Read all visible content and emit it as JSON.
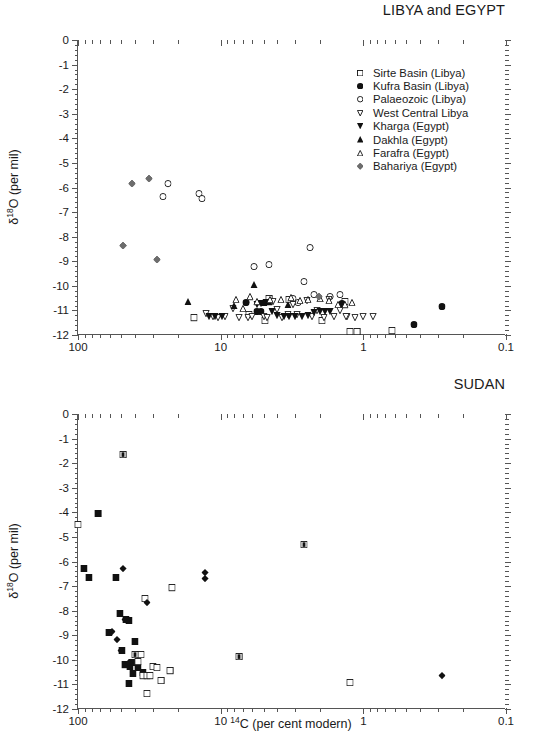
{
  "figure": {
    "xlabel_pre": "14",
    "xlabel_post": "C (per cent modern)",
    "ylabel_pre": "δ",
    "ylabel_sup": "18",
    "ylabel_post": "O (per mil)",
    "caption": ""
  },
  "panels": [
    {
      "id": "libya-egypt",
      "title": "LIBYA and EGYPT",
      "legend": [
        {
          "label": "Sirte Basin (Libya)",
          "marker": "open-square"
        },
        {
          "label": "Kufra Basin (Libya)",
          "marker": "filled-circle"
        },
        {
          "label": "Palaeozoic (Libya)",
          "marker": "open-circle"
        },
        {
          "label": "West Central Libya",
          "marker": "open-down-triangle"
        },
        {
          "label": "Kharga (Egypt)",
          "marker": "filled-down-triangle"
        },
        {
          "label": "Dakhla (Egypt)",
          "marker": "filled-up-triangle"
        },
        {
          "label": "Farafra (Egypt)",
          "marker": "open-up-triangle"
        },
        {
          "label": "Bahariya (Egypt)",
          "marker": "gray-diamond"
        }
      ]
    },
    {
      "id": "sudan",
      "title": "SUDAN",
      "legend": [
        {
          "label": "Darfur",
          "marker": "filled-square"
        },
        {
          "label": "Kordofan",
          "marker": "open-square"
        },
        {
          "label": "Dongola",
          "marker": "crossed-square"
        },
        {
          "label": "Butana",
          "marker": "filled-diamond"
        }
      ]
    }
  ],
  "chart_data": [
    {
      "type": "scatter",
      "title": "LIBYA and EGYPT",
      "xlabel": "14C (per cent modern)",
      "ylabel": "d18O (per mil)",
      "xscale": "log",
      "xlim": [
        100,
        0.1
      ],
      "ylim": [
        -12,
        0
      ],
      "xticks": [
        100,
        10,
        1,
        0.1
      ],
      "yticks": [
        0,
        -1,
        -2,
        -3,
        -4,
        -5,
        -6,
        -7,
        -8,
        -9,
        -10,
        -11,
        -12
      ],
      "grid": false,
      "legend_position": "upper-right",
      "series": [
        {
          "name": "Sirte Basin (Libya)",
          "marker": "open-square",
          "points": [
            [
              15.4,
              -11.25
            ],
            [
              6.3,
              -11.1
            ],
            [
              4.9,
              -11.35
            ],
            [
              4.55,
              -10.45
            ],
            [
              3.3,
              -10.5
            ],
            [
              1.95,
              -11.35
            ],
            [
              1.35,
              -10.6
            ],
            [
              1.25,
              -11.8
            ],
            [
              1.1,
              -11.8
            ],
            [
              0.63,
              -11.78
            ]
          ]
        },
        {
          "name": "Kufra Basin (Libya)",
          "marker": "filled-circle",
          "points": [
            [
              6.6,
              -10.62
            ],
            [
              5.6,
              -11.0
            ],
            [
              5.2,
              -11.0
            ],
            [
              1.42,
              -10.68
            ],
            [
              0.44,
              -11.5
            ],
            [
              0.28,
              -10.78
            ]
          ]
        },
        {
          "name": "Palaeozoic (Libya)",
          "marker": "open-circle",
          "points": [
            [
              23.5,
              -5.8
            ],
            [
              25.5,
              -6.3
            ],
            [
              14.3,
              -6.2
            ],
            [
              13.6,
              -6.4
            ],
            [
              5.8,
              -9.15
            ],
            [
              4.6,
              -9.07
            ],
            [
              2.35,
              -8.37
            ],
            [
              2.6,
              -9.78
            ],
            [
              2.2,
              -10.3
            ],
            [
              1.7,
              -10.4
            ],
            [
              1.45,
              -10.28
            ],
            [
              3.1,
              -10.45
            ],
            [
              2.85,
              -10.62
            ]
          ]
        },
        {
          "name": "West Central Libya",
          "marker": "open-down-triangle",
          "points": [
            [
              12.6,
              -11.08
            ],
            [
              11.4,
              -11.2
            ],
            [
              10.4,
              -11.25
            ],
            [
              9.3,
              -11.2
            ],
            [
              8.2,
              -10.85
            ],
            [
              7.4,
              -11.25
            ],
            [
              6.4,
              -11.22
            ],
            [
              6.0,
              -11.2
            ],
            [
              5.0,
              -11.2
            ],
            [
              4.7,
              -11.22
            ],
            [
              4.3,
              -10.6
            ],
            [
              4.0,
              -10.9
            ],
            [
              3.7,
              -11.22
            ],
            [
              3.4,
              -11.1
            ],
            [
              3.1,
              -10.7
            ],
            [
              2.9,
              -11.1
            ],
            [
              2.5,
              -10.55
            ],
            [
              2.3,
              -11.2
            ],
            [
              2.1,
              -10.95
            ],
            [
              1.9,
              -11.25
            ],
            [
              1.75,
              -10.5
            ],
            [
              1.6,
              -11.2
            ],
            [
              1.45,
              -10.95
            ],
            [
              1.3,
              -11.2
            ],
            [
              1.15,
              -11.22
            ],
            [
              1.0,
              -11.18
            ],
            [
              0.85,
              -11.2
            ],
            [
              1.32,
              -11.2
            ]
          ]
        },
        {
          "name": "Kharga (Egypt)",
          "marker": "filled-down-triangle",
          "points": [
            [
              12.0,
              -11.2
            ],
            [
              11.0,
              -11.2
            ],
            [
              9.8,
              -11.18
            ],
            [
              5.6,
              -10.7
            ],
            [
              5.2,
              -10.65
            ],
            [
              4.8,
              -10.62
            ],
            [
              4.4,
              -11.0
            ],
            [
              4.0,
              -11.15
            ],
            [
              3.6,
              -11.18
            ],
            [
              3.3,
              -11.2
            ],
            [
              3.0,
              -11.2
            ],
            [
              2.7,
              -11.18
            ],
            [
              2.45,
              -11.15
            ],
            [
              2.2,
              -11.05
            ],
            [
              2.0,
              -11.0
            ],
            [
              1.85,
              -11.0
            ],
            [
              1.7,
              -11.0
            ]
          ]
        },
        {
          "name": "Dakhla (Egypt)",
          "marker": "filled-up-triangle",
          "points": [
            [
              17.0,
              -10.58
            ],
            [
              8.0,
              -10.75
            ],
            [
              5.8,
              -9.9
            ],
            [
              5.0,
              -10.62
            ],
            [
              4.6,
              -10.6
            ],
            [
              3.4,
              -10.7
            ]
          ]
        },
        {
          "name": "Farafra (Egypt)",
          "marker": "open-up-triangle",
          "points": [
            [
              7.8,
              -10.5
            ],
            [
              7.0,
              -10.85
            ],
            [
              6.2,
              -10.4
            ],
            [
              5.6,
              -10.6
            ],
            [
              4.5,
              -10.52
            ],
            [
              3.8,
              -10.5
            ],
            [
              3.2,
              -10.42
            ],
            [
              2.8,
              -10.55
            ],
            [
              2.45,
              -10.5
            ],
            [
              2.0,
              -10.45
            ],
            [
              1.75,
              -10.55
            ],
            [
              1.5,
              -10.7
            ],
            [
              1.35,
              -10.72
            ],
            [
              1.2,
              -10.62
            ]
          ]
        },
        {
          "name": "Bahariya (Egypt)",
          "marker": "gray-diamond",
          "points": [
            [
              42.0,
              -5.78
            ],
            [
              32.0,
              -5.58
            ],
            [
              48.0,
              -8.3
            ],
            [
              28.0,
              -8.88
            ],
            [
              2.05,
              -10.4
            ]
          ]
        }
      ]
    },
    {
      "type": "scatter",
      "title": "SUDAN",
      "xlabel": "14C (per cent modern)",
      "ylabel": "d18O (per mil)",
      "xscale": "log",
      "xlim": [
        100,
        0.1
      ],
      "ylim": [
        -12,
        0
      ],
      "xticks": [
        100,
        10,
        1,
        0.1
      ],
      "yticks": [
        0,
        -1,
        -2,
        -3,
        -4,
        -5,
        -6,
        -7,
        -8,
        -9,
        -10,
        -11,
        -12
      ],
      "grid": false,
      "legend_position": "upper-right",
      "series": [
        {
          "name": "Darfur",
          "marker": "filled-square",
          "points": [
            [
              72.0,
              -3.98
            ],
            [
              91.0,
              -6.22
            ],
            [
              84.0,
              -6.6
            ],
            [
              54.0,
              -6.6
            ],
            [
              51.0,
              -8.05
            ],
            [
              61.0,
              -8.82
            ],
            [
              46.0,
              -8.3
            ],
            [
              44.0,
              -8.35
            ],
            [
              49.0,
              -9.55
            ],
            [
              40.0,
              -9.2
            ],
            [
              47.0,
              -10.15
            ],
            [
              42.0,
              -10.05
            ],
            [
              41.0,
              -10.5
            ],
            [
              38.0,
              -10.25
            ],
            [
              35.0,
              -10.45
            ],
            [
              44.0,
              -10.9
            ],
            [
              43.0,
              -10.2
            ],
            [
              46.0,
              -10.12
            ]
          ]
        },
        {
          "name": "Kordofan",
          "marker": "open-square",
          "points": [
            [
              100.0,
              -4.45
            ],
            [
              34.0,
              -7.45
            ],
            [
              22.0,
              -7.02
            ],
            [
              36.0,
              -9.73
            ],
            [
              38.0,
              -10.0
            ],
            [
              35.0,
              -10.6
            ],
            [
              33.0,
              -10.6
            ],
            [
              31.5,
              -10.6
            ],
            [
              30.0,
              -10.22
            ],
            [
              26.0,
              -10.78
            ],
            [
              22.5,
              -10.4
            ],
            [
              33.0,
              -11.32
            ],
            [
              28.0,
              -10.25
            ],
            [
              1.25,
              -10.85
            ]
          ]
        },
        {
          "name": "Dongola",
          "marker": "crossed-square",
          "points": [
            [
              48.0,
              -1.58
            ],
            [
              2.6,
              -5.25
            ],
            [
              40.0,
              -9.73
            ],
            [
              7.4,
              -9.8
            ]
          ]
        },
        {
          "name": "Butana",
          "marker": "filled-diamond",
          "points": [
            [
              48.0,
              -6.22
            ],
            [
              58.0,
              -8.8
            ],
            [
              53.0,
              -9.1
            ],
            [
              50.0,
              -9.55
            ],
            [
              47.0,
              -8.3
            ],
            [
              45.0,
              -8.32
            ],
            [
              44.0,
              -10.05
            ],
            [
              33.0,
              -7.6
            ],
            [
              12.8,
              -6.4
            ],
            [
              12.8,
              -6.65
            ],
            [
              0.28,
              -10.6
            ]
          ]
        }
      ]
    }
  ]
}
